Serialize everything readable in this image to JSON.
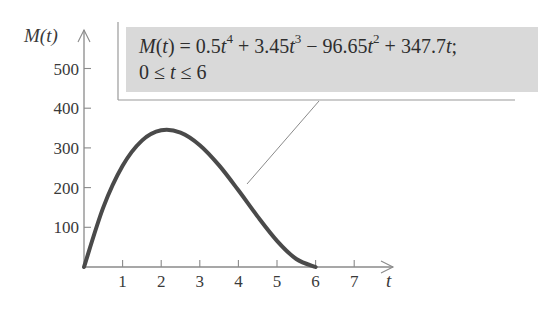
{
  "chart_data": {
    "type": "line",
    "title": "",
    "xlabel": "t",
    "ylabel": "M(t)",
    "xlim": [
      0,
      7.7
    ],
    "ylim": [
      0,
      560
    ],
    "x_ticks": [
      1,
      2,
      3,
      4,
      5,
      6,
      7
    ],
    "y_ticks": [
      100,
      200,
      300,
      400,
      500
    ],
    "grid": false,
    "legend": null,
    "series": [
      {
        "name": "M(t)",
        "color": "#4a4a4a",
        "x": [
          0,
          0.5,
          1,
          1.5,
          2,
          2.5,
          3,
          3.5,
          4,
          4.5,
          5,
          5.5,
          6
        ],
        "values": [
          0,
          150.2,
          255.0,
          318.3,
          344.4,
          338.6,
          306.9,
          255.9,
          193.2,
          126.9,
          66.0,
          20.2,
          0
        ]
      }
    ],
    "annotations": [
      {
        "text_line1": "M(t) = 0.5t^4 + 3.45t^3 − 96.65t^2 + 347.7t;",
        "text_line2": "0 ≤ t ≤ 6",
        "points_to": {
          "t": 4.2,
          "approx_value": 165
        }
      }
    ]
  },
  "formula": {
    "fn": "M",
    "var": "t",
    "eq": " = 0.5",
    "p1": " + 3.45",
    "p2": " − 96.65",
    "p3": " + 347.7",
    "exp4": "4",
    "exp3": "3",
    "exp2": "2",
    "end": ";",
    "domain_lo": "0 ≤ ",
    "domain_hi": " ≤ 6"
  },
  "colors": {
    "curve": "#4a4a4a",
    "axis": "#8a8a8a",
    "box_fill": "#d9d9d9",
    "text": "#3a3a3a"
  }
}
